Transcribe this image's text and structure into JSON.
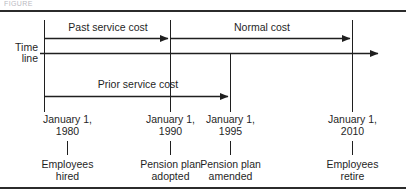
{
  "figure": {
    "clipped_header_text": "FIGURE",
    "axis_label_line1": "Time",
    "axis_label_line2": "line",
    "spans": [
      {
        "id": "past-service-cost",
        "label": "Past service cost",
        "from_date": "January 1, 1980",
        "to_date": "January 1, 1990"
      },
      {
        "id": "normal-cost",
        "label": "Normal cost",
        "from_date": "January 1, 1990",
        "to_date": "January 1, 2010"
      },
      {
        "id": "prior-service-cost",
        "label": "Prior service cost",
        "from_date": "January 1, 1980",
        "to_date": "January 1, 1995"
      }
    ],
    "milestones": [
      {
        "id": "employees-hired",
        "date_line1": "January 1,",
        "date_line2": "1980",
        "event_line1": "Employees",
        "event_line2": "hired"
      },
      {
        "id": "pension-plan-adopted",
        "date_line1": "January 1,",
        "date_line2": "1990",
        "event_line1": "Pension plan",
        "event_line2": "adopted"
      },
      {
        "id": "pension-plan-amended",
        "date_line1": "January 1,",
        "date_line2": "1995",
        "event_line1": "Pension plan",
        "event_line2": "amended"
      },
      {
        "id": "employees-retire",
        "date_line1": "January 1,",
        "date_line2": "2010",
        "event_line1": "Employees",
        "event_line2": "retire"
      }
    ],
    "colors": {
      "ink": "#1f1f1f",
      "rule": "#2b2b2b",
      "background": "#ffffff"
    }
  }
}
